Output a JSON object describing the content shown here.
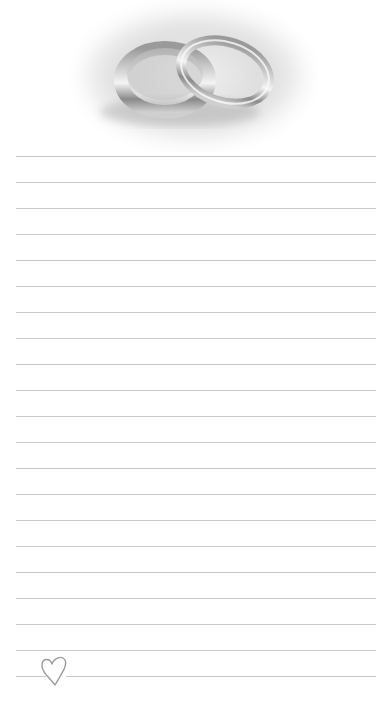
{
  "notepad": {
    "header_image": "wedding-rings",
    "line_color": "#c9c9c9",
    "line_count": 21,
    "line_left": 16,
    "line_right": 376,
    "first_line_y": 156,
    "line_spacing": 26,
    "footer_icon": "heart-outline"
  }
}
